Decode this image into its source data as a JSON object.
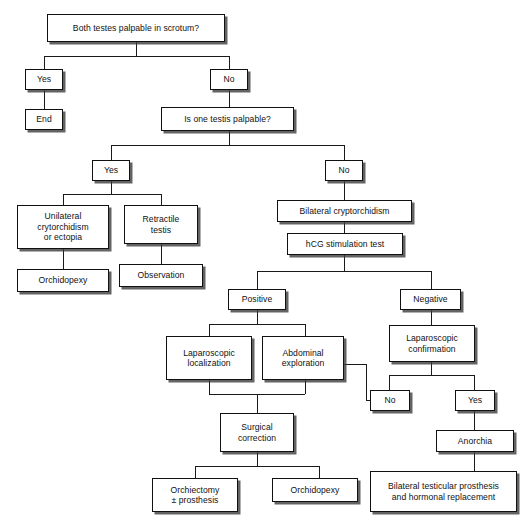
{
  "diagram": {
    "type": "flowchart",
    "colors": {
      "box_border": "#111111",
      "box_fill": "#ffffff",
      "line": "#1a1a1a",
      "shadow": "rgba(60,60,60,0.80)",
      "text": "#111111"
    },
    "nodes": [
      {
        "id": "n1",
        "label": "Both testes palpable in scrotum?",
        "role": "decision-question"
      },
      {
        "id": "n2",
        "label": "Yes",
        "role": "branch-label"
      },
      {
        "id": "n3",
        "label": "No",
        "role": "branch-label"
      },
      {
        "id": "n4",
        "label": "End",
        "role": "terminal"
      },
      {
        "id": "n5",
        "label": "Is one testis palpable?",
        "role": "decision-question"
      },
      {
        "id": "n6",
        "label": "Yes",
        "role": "branch-label"
      },
      {
        "id": "n7",
        "label": "No",
        "role": "branch-label"
      },
      {
        "id": "n8",
        "label": "Unilateral\ncrytorchidism\nor ectopia",
        "role": "diagnosis"
      },
      {
        "id": "n9",
        "label": "Retractile\ntestis",
        "role": "diagnosis"
      },
      {
        "id": "n10",
        "label": "Orchidopexy",
        "role": "treatment"
      },
      {
        "id": "n11",
        "label": "Observation",
        "role": "treatment"
      },
      {
        "id": "n12",
        "label": "Bilateral cryptorchidism",
        "role": "diagnosis"
      },
      {
        "id": "n13",
        "label": "hCG stimulation test",
        "role": "test"
      },
      {
        "id": "n14",
        "label": "Positive",
        "role": "branch-label"
      },
      {
        "id": "n15",
        "label": "Negative",
        "role": "branch-label"
      },
      {
        "id": "n16",
        "label": "Laparoscopic\nlocalization",
        "role": "procedure"
      },
      {
        "id": "n17",
        "label": "Abdominal\nexploration",
        "role": "procedure"
      },
      {
        "id": "n18",
        "label": "Laparoscopic\nconfirmation",
        "role": "procedure"
      },
      {
        "id": "n19",
        "label": "No",
        "role": "branch-label"
      },
      {
        "id": "n20",
        "label": "Yes",
        "role": "branch-label"
      },
      {
        "id": "n21",
        "label": "Anorchia",
        "role": "diagnosis"
      },
      {
        "id": "n22",
        "label": "Surgical\ncorrection",
        "role": "treatment"
      },
      {
        "id": "n23",
        "label": "Orchiectomy\n± prosthesis",
        "role": "treatment"
      },
      {
        "id": "n24",
        "label": "Orchidopexy",
        "role": "treatment"
      },
      {
        "id": "n25",
        "label": "Bilateral testicular prosthesis\nand hormonal replacement",
        "role": "treatment"
      }
    ],
    "edges": [
      {
        "from": "n1",
        "to": "n2"
      },
      {
        "from": "n1",
        "to": "n3"
      },
      {
        "from": "n2",
        "to": "n4"
      },
      {
        "from": "n3",
        "to": "n5"
      },
      {
        "from": "n5",
        "to": "n6"
      },
      {
        "from": "n5",
        "to": "n7"
      },
      {
        "from": "n6",
        "to": "n8"
      },
      {
        "from": "n6",
        "to": "n9"
      },
      {
        "from": "n8",
        "to": "n10"
      },
      {
        "from": "n9",
        "to": "n11"
      },
      {
        "from": "n7",
        "to": "n12"
      },
      {
        "from": "n12",
        "to": "n13"
      },
      {
        "from": "n13",
        "to": "n14"
      },
      {
        "from": "n13",
        "to": "n15"
      },
      {
        "from": "n14",
        "to": "n16"
      },
      {
        "from": "n14",
        "to": "n17"
      },
      {
        "from": "n15",
        "to": "n18"
      },
      {
        "from": "n18",
        "to": "n19"
      },
      {
        "from": "n18",
        "to": "n20"
      },
      {
        "from": "n19",
        "to": "n17",
        "arrow": true
      },
      {
        "from": "n20",
        "to": "n21"
      },
      {
        "from": "n16",
        "to": "n22"
      },
      {
        "from": "n17",
        "to": "n22"
      },
      {
        "from": "n22",
        "to": "n23"
      },
      {
        "from": "n22",
        "to": "n24"
      },
      {
        "from": "n21",
        "to": "n25"
      }
    ]
  },
  "caption": {
    "text": ""
  }
}
